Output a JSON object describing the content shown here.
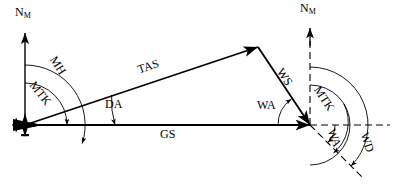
{
  "diagram": {
    "background_color": "#ffffff",
    "stroke_color": "#000000",
    "width": 397,
    "height": 189
  },
  "labels": {
    "north_magnetic_left": {
      "text": "N",
      "subscript": "M"
    },
    "north_magnetic_right": {
      "text": "N",
      "subscript": "M"
    },
    "mh": "MH",
    "mtk_left": "MTK",
    "mtk_right": "MTK",
    "tas": "TAS",
    "da": "DA",
    "gs": "GS",
    "ws": "WS",
    "wa_left": "WA",
    "wa_right": "WA",
    "wd": "WD"
  },
  "geometry": {
    "origin": {
      "x": 25,
      "y": 125
    },
    "apex": {
      "x": 258,
      "y": 47
    },
    "junction": {
      "x": 310,
      "y": 125
    },
    "north_left_top": {
      "x": 25,
      "y": 33
    },
    "north_right_top": {
      "x": 310,
      "y": 28
    },
    "wd_end": {
      "x": 360,
      "y": 175
    },
    "arcs": {
      "mh_radius": 60,
      "mtk_left_radius": 42,
      "da_radius": 90,
      "mtk_right_radius": 40,
      "wa_right_radius": 25,
      "wd_radius": 58,
      "wa_left_radius": 32
    }
  },
  "icons": {
    "aircraft": "aircraft-icon",
    "arrowhead": "arrowhead-icon"
  }
}
